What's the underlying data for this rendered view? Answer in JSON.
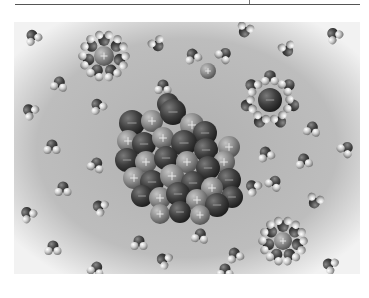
{
  "figure": {
    "colors": {
      "background_center": "#b4b4b4",
      "background_edge": "#f4f4f4",
      "anion": "#3c3c3c",
      "cation": "#8a8a8a",
      "oxygen": "#474747",
      "hydrogen": "#d6d6d6",
      "rule": "#555555"
    },
    "symbols": {
      "cation_sign": "+",
      "anion_sign": "−"
    },
    "crystal": {
      "cx": 172,
      "cy": 138,
      "ions": [
        {
          "x": 132,
          "y": 123,
          "r": 13,
          "t": "a"
        },
        {
          "x": 152,
          "y": 121,
          "r": 11,
          "t": "c"
        },
        {
          "x": 173,
          "y": 112,
          "r": 13,
          "t": "a"
        },
        {
          "x": 192,
          "y": 125,
          "r": 12,
          "t": "c"
        },
        {
          "x": 205,
          "y": 133,
          "r": 12,
          "t": "a"
        },
        {
          "x": 229,
          "y": 147,
          "r": 11,
          "t": "c"
        },
        {
          "x": 128,
          "y": 141,
          "r": 11,
          "t": "c"
        },
        {
          "x": 144,
          "y": 144,
          "r": 12,
          "t": "a"
        },
        {
          "x": 163,
          "y": 138,
          "r": 11,
          "t": "c"
        },
        {
          "x": 184,
          "y": 143,
          "r": 13,
          "t": "a"
        },
        {
          "x": 206,
          "y": 150,
          "r": 12,
          "t": "a"
        },
        {
          "x": 224,
          "y": 162,
          "r": 11,
          "t": "c"
        },
        {
          "x": 127,
          "y": 160,
          "r": 12,
          "t": "a"
        },
        {
          "x": 146,
          "y": 162,
          "r": 11,
          "t": "c"
        },
        {
          "x": 166,
          "y": 158,
          "r": 12,
          "t": "a"
        },
        {
          "x": 187,
          "y": 162,
          "r": 11,
          "t": "c"
        },
        {
          "x": 208,
          "y": 168,
          "r": 12,
          "t": "a"
        },
        {
          "x": 229,
          "y": 180,
          "r": 12,
          "t": "a"
        },
        {
          "x": 134,
          "y": 178,
          "r": 11,
          "t": "c"
        },
        {
          "x": 152,
          "y": 182,
          "r": 12,
          "t": "a"
        },
        {
          "x": 172,
          "y": 176,
          "r": 12,
          "t": "c"
        },
        {
          "x": 193,
          "y": 183,
          "r": 12,
          "t": "a"
        },
        {
          "x": 212,
          "y": 188,
          "r": 11,
          "t": "c"
        },
        {
          "x": 232,
          "y": 197,
          "r": 11,
          "t": "a"
        },
        {
          "x": 142,
          "y": 196,
          "r": 11,
          "t": "a"
        },
        {
          "x": 160,
          "y": 198,
          "r": 11,
          "t": "c"
        },
        {
          "x": 178,
          "y": 194,
          "r": 12,
          "t": "a"
        },
        {
          "x": 197,
          "y": 200,
          "r": 11,
          "t": "c"
        },
        {
          "x": 217,
          "y": 205,
          "r": 12,
          "t": "a"
        },
        {
          "x": 160,
          "y": 214,
          "r": 10,
          "t": "c"
        },
        {
          "x": 180,
          "y": 212,
          "r": 11,
          "t": "a"
        },
        {
          "x": 200,
          "y": 215,
          "r": 10,
          "t": "c"
        }
      ]
    },
    "free_ions": [
      {
        "x": 168,
        "y": 104,
        "r": 11,
        "t": "a",
        "label": "free-anion"
      },
      {
        "x": 208,
        "y": 71,
        "r": 8,
        "t": "c",
        "label": "free-cation"
      }
    ],
    "hydrated_ions": [
      {
        "x": 104,
        "y": 56,
        "r": 10,
        "t": "c",
        "shell_r": 18,
        "n": 7,
        "label": "hydrated-cation-top-left"
      },
      {
        "x": 270,
        "y": 100,
        "r": 12,
        "t": "a",
        "shell_r": 22,
        "n": 7,
        "label": "hydrated-anion-right"
      },
      {
        "x": 283,
        "y": 241,
        "r": 9,
        "t": "c",
        "shell_r": 17,
        "n": 7,
        "label": "hydrated-cation-bottom-right"
      }
    ],
    "water_molecules": [
      {
        "x": 33,
        "y": 37,
        "a": -30
      },
      {
        "x": 59,
        "y": 84,
        "a": 10
      },
      {
        "x": 157,
        "y": 44,
        "a": 150
      },
      {
        "x": 193,
        "y": 56,
        "a": -20
      },
      {
        "x": 163,
        "y": 87,
        "a": 0
      },
      {
        "x": 224,
        "y": 55,
        "a": 40
      },
      {
        "x": 245,
        "y": 30,
        "a": 200
      },
      {
        "x": 287,
        "y": 49,
        "a": 160
      },
      {
        "x": 334,
        "y": 35,
        "a": -40
      },
      {
        "x": 30,
        "y": 111,
        "a": -50
      },
      {
        "x": 98,
        "y": 106,
        "a": -30
      },
      {
        "x": 52,
        "y": 147,
        "a": 0
      },
      {
        "x": 96,
        "y": 165,
        "a": 20
      },
      {
        "x": 63,
        "y": 189,
        "a": 0
      },
      {
        "x": 100,
        "y": 207,
        "a": -60
      },
      {
        "x": 28,
        "y": 214,
        "a": -40
      },
      {
        "x": 312,
        "y": 129,
        "a": 10
      },
      {
        "x": 346,
        "y": 149,
        "a": 40
      },
      {
        "x": 266,
        "y": 154,
        "a": -20
      },
      {
        "x": 274,
        "y": 183,
        "a": 30
      },
      {
        "x": 315,
        "y": 201,
        "a": 200
      },
      {
        "x": 304,
        "y": 161,
        "a": -10
      },
      {
        "x": 253,
        "y": 187,
        "a": -50
      },
      {
        "x": 53,
        "y": 248,
        "a": 0
      },
      {
        "x": 96,
        "y": 269,
        "a": 20
      },
      {
        "x": 139,
        "y": 243,
        "a": 0
      },
      {
        "x": 164,
        "y": 260,
        "a": -60
      },
      {
        "x": 200,
        "y": 236,
        "a": 10
      },
      {
        "x": 235,
        "y": 255,
        "a": -20
      },
      {
        "x": 225,
        "y": 271,
        "a": 0
      },
      {
        "x": 330,
        "y": 265,
        "a": -60
      }
    ]
  }
}
